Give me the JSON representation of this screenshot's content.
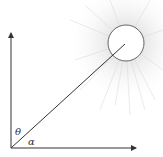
{
  "diagram": {
    "labels": {
      "theta": "θ",
      "alpha": "α"
    },
    "elements": {
      "origin": [
        11,
        148
      ],
      "vertical_axis_tip": [
        11,
        32
      ],
      "horizontal_axis_tip": [
        137,
        148
      ],
      "sun_center": [
        126,
        43
      ],
      "sun_radius": 18,
      "ray_end": [
        125,
        44
      ]
    },
    "colors": {
      "line": "#333333",
      "sun_outline": "#555555",
      "glow": "#d8d8d8"
    }
  }
}
